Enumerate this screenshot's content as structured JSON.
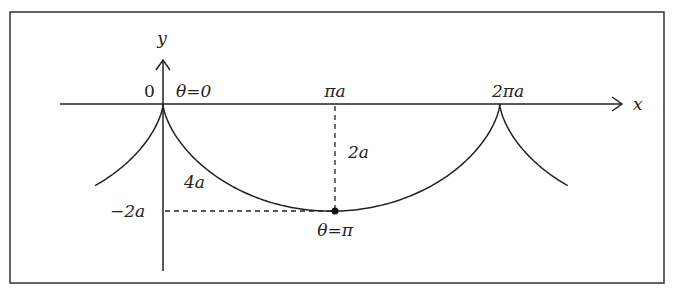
{
  "diagram": {
    "type": "cycloid",
    "axes": {
      "x_label": "x",
      "y_label": "y"
    },
    "labels": {
      "origin": "0",
      "theta_zero": "θ=0",
      "pi_a": "πa",
      "two_pi_a": "2πa",
      "height": "2a",
      "arc_length": "4a",
      "minus_two_a": "−2a",
      "theta_pi": "θ=π"
    },
    "curve": {
      "equation_x": "a(θ − sin θ)",
      "equation_y": "−a(1 − cos θ)",
      "cusps_x": [
        "0",
        "2πa"
      ],
      "minimum": {
        "x": "πa",
        "y": "−2a",
        "theta": "π"
      }
    },
    "colors": {
      "stroke": "#222222",
      "frame": "#333333"
    }
  }
}
